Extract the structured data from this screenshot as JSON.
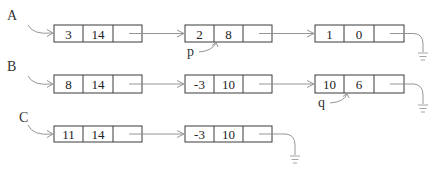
{
  "lists": [
    {
      "label": "A",
      "nodes": [
        {
          "data": "3",
          "next": "14"
        },
        {
          "data": "2",
          "next": "8"
        },
        {
          "data": "1",
          "next": "0"
        }
      ]
    },
    {
      "label": "B",
      "nodes": [
        {
          "data": "8",
          "next": "14"
        },
        {
          "data": "-3",
          "next": "10"
        },
        {
          "data": "10",
          "next": "6"
        }
      ]
    },
    {
      "label": "C",
      "nodes": [
        {
          "data": "11",
          "next": "14"
        },
        {
          "data": "-3",
          "next": "10"
        }
      ]
    }
  ],
  "pointers": [
    {
      "label": "p",
      "target": "A.node2.field2"
    },
    {
      "label": "q",
      "target": "B.node3.field2"
    }
  ],
  "colors": {
    "box_stroke": "#3a3a3a",
    "link_stroke": "#8a8a8a",
    "text": "#222222"
  }
}
